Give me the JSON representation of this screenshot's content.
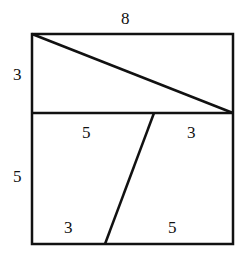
{
  "figure": {
    "top_rect": {
      "width_label": "8",
      "height_label": "3"
    },
    "bottom_square": {
      "height_label": "5",
      "top_left_segment": "5",
      "top_right_segment": "3",
      "bottom_left_segment": "3",
      "bottom_right_segment": "5"
    },
    "stroke_color": "#111111"
  }
}
